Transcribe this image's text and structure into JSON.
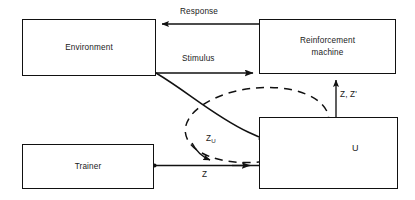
{
  "diagram": {
    "background_color": "#ffffff",
    "line_color": "#111111",
    "nodes": [
      {
        "id": "environment",
        "label": "Environment",
        "x": 22,
        "y": 19,
        "w": 134,
        "h": 57
      },
      {
        "id": "reinforcement-machine",
        "label": "Reinforcement\nmachine",
        "x": 259,
        "y": 19,
        "w": 137,
        "h": 55
      },
      {
        "id": "trainer",
        "label": "Trainer",
        "x": 22,
        "y": 144,
        "w": 132,
        "h": 45
      },
      {
        "id": "u-block",
        "label": "U",
        "x": 259,
        "y": 117,
        "w": 139,
        "h": 72
      }
    ],
    "edges": [
      {
        "id": "response",
        "label": "Response",
        "from": "reinforcement-machine",
        "to": "environment",
        "label_x": 180,
        "label_y": 7
      },
      {
        "id": "stimulus",
        "label": "Stimulus",
        "from": "environment",
        "to": "reinforcement-machine",
        "label_x": 182,
        "label_y": 54
      },
      {
        "id": "z-zprime",
        "label": "Z, Z'",
        "from": "u-block",
        "to": "reinforcement-machine",
        "label_x": 340,
        "label_y": 90
      },
      {
        "id": "z-trainer",
        "label": "Z",
        "from": "trainer",
        "to": "u-block",
        "label_x": 202,
        "label_y": 170
      },
      {
        "id": "zu-loop",
        "label": "Z",
        "sublabel": "U",
        "from": "u-block",
        "to": "u-block",
        "label_x": 206,
        "label_y": 134
      }
    ],
    "decorations": [
      {
        "id": "hand-sketch",
        "name": "hand-pointer-sketch"
      },
      {
        "id": "dashed-ellipse",
        "name": "dashed-feedback-loop"
      },
      {
        "id": "environment-to-hand-curve",
        "name": "curved-connector"
      }
    ]
  }
}
